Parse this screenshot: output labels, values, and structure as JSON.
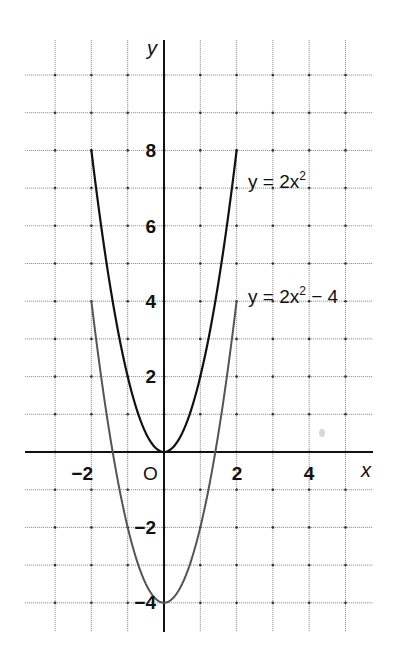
{
  "chart_data": {
    "type": "line",
    "title": "",
    "xlabel": "x",
    "ylabel": "y",
    "origin_label": "O",
    "xlim": [
      -4,
      5.7
    ],
    "ylim": [
      -4.8,
      10.9
    ],
    "grid": true,
    "grid_step": 1,
    "x_ticks": [
      {
        "value": -2,
        "label": "−2"
      },
      {
        "value": 2,
        "label": "2"
      },
      {
        "value": 4,
        "label": "4"
      }
    ],
    "y_ticks": [
      {
        "value": 8,
        "label": "8"
      },
      {
        "value": 6,
        "label": "6"
      },
      {
        "value": 4,
        "label": "4"
      },
      {
        "value": 2,
        "label": "2"
      },
      {
        "value": -2,
        "label": "−2"
      },
      {
        "value": -4,
        "label": "−4"
      }
    ],
    "series": [
      {
        "name": "y = 2x²",
        "label_base": "y = 2x",
        "label_sup": "2",
        "label_tail": "",
        "color": "#111111",
        "x": [
          -2,
          -1.5,
          -1,
          -0.5,
          0,
          0.5,
          1,
          1.5,
          2
        ],
        "values": [
          8,
          4.5,
          2,
          0.5,
          0,
          0.5,
          2,
          4.5,
          8
        ]
      },
      {
        "name": "y = 2x² − 4",
        "label_base": "y = 2x",
        "label_sup": "2",
        "label_tail": " − 4",
        "color": "#555555",
        "x": [
          -2,
          -1.5,
          -1,
          -0.5,
          0,
          0.5,
          1,
          1.5,
          2
        ],
        "values": [
          4,
          0.5,
          -2,
          -3.5,
          -4,
          -3.5,
          -2,
          0.5,
          4
        ]
      }
    ]
  }
}
